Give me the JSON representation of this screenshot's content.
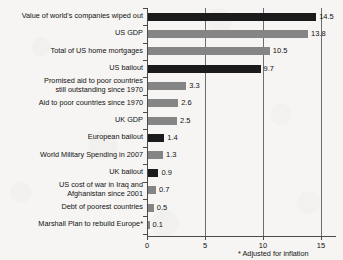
{
  "chart_data": {
    "type": "bar",
    "orientation": "horizontal",
    "title": "",
    "xlabel": "",
    "ylabel": "",
    "xlim": [
      0,
      16.3
    ],
    "xticks": [
      0,
      5,
      10,
      15
    ],
    "xtick_labels": [
      "0",
      "5",
      "10",
      "15"
    ],
    "grid": "vertical",
    "legend": "none",
    "units_note": "trillions of US dollars",
    "footnote": "* Adjusted for inflation",
    "colors": {
      "dark": "#1b1b1b",
      "light": "#858585",
      "background": "#f6f5f3",
      "axis": "#4a4a4a",
      "gridline": "#6d6d6d",
      "text": "#121212"
    },
    "categories": [
      "Value of world's companies wiped out",
      "US GDP",
      "Total of US home mortgages",
      "US bailout",
      "Promised aid to poor countries\nstill outstanding since 1970",
      "Aid to poor countries since 1970",
      "UK GDP",
      "European bailout",
      "World Military Spending in 2007",
      "UK bailout",
      "US cost of war in Iraq and\nAfghanistan since 2001",
      "Debt of poorest countries",
      "Marshall Plan to rebuild Europe*"
    ],
    "values": [
      14.5,
      13.8,
      10.5,
      9.7,
      3.3,
      2.6,
      2.5,
      1.4,
      1.3,
      0.9,
      0.7,
      0.5,
      0.1
    ],
    "value_labels": [
      "14.5",
      "13.8",
      "10.5",
      "9.7",
      "3.3",
      "2.6",
      "2.5",
      "1.4",
      "1.3",
      "0.9",
      "0.7",
      "0.5",
      "0.1"
    ],
    "bar_shades": [
      "dark",
      "light",
      "light",
      "dark",
      "light",
      "light",
      "light",
      "dark",
      "light",
      "dark",
      "light",
      "light",
      "light"
    ]
  }
}
